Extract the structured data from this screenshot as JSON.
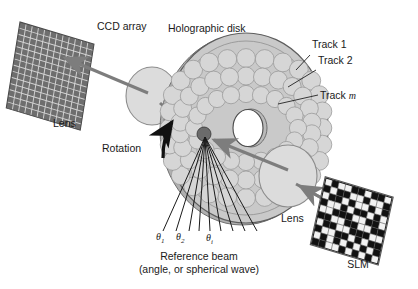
{
  "figure": {
    "title_label": "Holographic disk",
    "background_color": "#ffffff"
  },
  "labels": {
    "ccd_array": "CCD array",
    "holographic_disk": "Holographic disk",
    "track_1": "Track 1",
    "track_2": "Track 2",
    "track_m_prefix": "Track ",
    "track_m_italic": "m",
    "lens_left": "Lens",
    "lens_right": "Lens",
    "rotation": "Rotation",
    "slm": "SLM",
    "reference_beam_line1": "Reference beam",
    "reference_beam_line2": "(angle, or spherical wave)"
  },
  "angles": {
    "theta_symbol": "θ",
    "theta_1_sub": "1",
    "theta_2_sub": "2",
    "theta_i_sub": "i"
  },
  "colors": {
    "disk_face": "#c9c9c9",
    "disk_hologram": "#d6d6d6",
    "disk_edge": "#b0b0b0",
    "disk_inner": "#c2c2c2",
    "lens_fill": "#dcdcdc",
    "lens_stroke": "#8c8c8c",
    "ccd_fill": "#6e6e6e",
    "ccd_grid": "#d8d8d8",
    "slm_on": "#111111",
    "slm_off": "#f2f2f2",
    "slm_grid": "#555555",
    "beam_arrow": "#7d7d7d",
    "rotation_arrow": "#111111",
    "leader_line": "#222222",
    "ref_fan": "#1a1a1a",
    "hologram_spot": "#6b6b6b",
    "text": "#1a1a1a"
  },
  "geometry": {
    "ccd": {
      "cols": 12,
      "rows": 14
    },
    "slm": {
      "cols": 10,
      "rows": 10
    },
    "disk": {
      "tracks": 3,
      "fan_rays": 9
    }
  },
  "slm_pattern": [
    [
      0,
      1,
      0,
      0,
      1,
      1,
      0,
      1,
      1,
      0
    ],
    [
      1,
      0,
      1,
      1,
      0,
      0,
      1,
      0,
      0,
      1
    ],
    [
      0,
      1,
      1,
      0,
      1,
      0,
      0,
      1,
      0,
      1
    ],
    [
      1,
      0,
      0,
      1,
      0,
      1,
      1,
      0,
      1,
      0
    ],
    [
      0,
      0,
      1,
      1,
      1,
      0,
      0,
      1,
      1,
      0
    ],
    [
      1,
      1,
      0,
      0,
      1,
      1,
      0,
      0,
      1,
      1
    ],
    [
      0,
      1,
      1,
      0,
      0,
      1,
      1,
      1,
      0,
      0
    ],
    [
      1,
      0,
      0,
      1,
      1,
      0,
      1,
      0,
      1,
      1
    ],
    [
      0,
      1,
      0,
      1,
      0,
      1,
      0,
      1,
      0,
      1
    ],
    [
      1,
      1,
      0,
      0,
      1,
      0,
      1,
      0,
      1,
      0
    ]
  ]
}
